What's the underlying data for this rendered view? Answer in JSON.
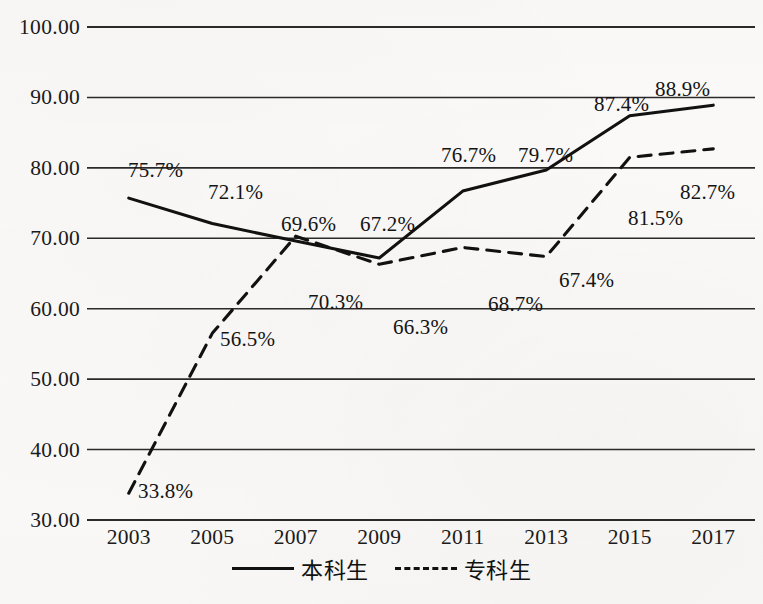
{
  "chart_data": {
    "type": "line",
    "title": "",
    "xlabel": "",
    "ylabel": "",
    "categories": [
      "2003",
      "2005",
      "2007",
      "2009",
      "2011",
      "2013",
      "2015",
      "2017"
    ],
    "ylim": [
      30,
      100
    ],
    "ytick_labels": [
      "100.00",
      "90.00",
      "80.00",
      "70.00",
      "60.00",
      "50.00",
      "40.00",
      "30.00"
    ],
    "ytick_values": [
      100,
      90,
      80,
      70,
      60,
      50,
      40,
      30
    ],
    "grid": true,
    "legend_position": "bottom-center",
    "series": [
      {
        "name": "本科生",
        "style": "solid",
        "color": "#111111",
        "values": [
          75.7,
          72.1,
          69.6,
          67.2,
          76.7,
          79.7,
          87.4,
          88.9
        ],
        "labels": [
          "75.7%",
          "72.1%",
          "69.6%",
          "67.2%",
          "76.7%",
          "79.7%",
          "87.4%",
          "88.9%"
        ]
      },
      {
        "name": "专科生",
        "style": "dashed",
        "color": "#111111",
        "values": [
          33.8,
          56.5,
          70.3,
          66.3,
          68.7,
          67.4,
          81.5,
          82.7
        ],
        "labels": [
          "33.8%",
          "56.5%",
          "70.3%",
          "66.3%",
          "68.7%",
          "67.4%",
          "81.5%",
          "82.7%"
        ]
      }
    ],
    "point_labels": [
      {
        "text": "75.7%",
        "series": "本科生",
        "category": "2003",
        "x": 128,
        "y": 158
      },
      {
        "text": "72.1%",
        "series": "本科生",
        "category": "2005",
        "x": 208,
        "y": 180
      },
      {
        "text": "69.6%",
        "series": "本科生",
        "category": "2007",
        "x": 281,
        "y": 212
      },
      {
        "text": "67.2%",
        "series": "本科生",
        "category": "2009",
        "x": 360,
        "y": 212
      },
      {
        "text": "76.7%",
        "series": "本科生",
        "category": "2011",
        "x": 441,
        "y": 143
      },
      {
        "text": "79.7%",
        "series": "本科生",
        "category": "2013",
        "x": 518,
        "y": 143
      },
      {
        "text": "87.4%",
        "series": "本科生",
        "category": "2015",
        "x": 594,
        "y": 92
      },
      {
        "text": "88.9%",
        "series": "本科生",
        "category": "2017",
        "x": 655,
        "y": 77
      },
      {
        "text": "33.8%",
        "series": "专科生",
        "category": "2003",
        "x": 138,
        "y": 479
      },
      {
        "text": "56.5%",
        "series": "专科生",
        "category": "2005",
        "x": 220,
        "y": 327
      },
      {
        "text": "70.3%",
        "series": "专科生",
        "category": "2007",
        "x": 308,
        "y": 290
      },
      {
        "text": "66.3%",
        "series": "专科生",
        "category": "2009",
        "x": 393,
        "y": 315
      },
      {
        "text": "68.7%",
        "series": "专科生",
        "category": "2011",
        "x": 488,
        "y": 292
      },
      {
        "text": "67.4%",
        "series": "专科生",
        "category": "2013",
        "x": 559,
        "y": 268
      },
      {
        "text": "81.5%",
        "series": "专科生",
        "category": "2015",
        "x": 628,
        "y": 206
      },
      {
        "text": "82.7%",
        "series": "专科生",
        "category": "2017",
        "x": 680,
        "y": 180
      }
    ]
  },
  "legend": {
    "entries": [
      {
        "label": "本科生",
        "style": "solid"
      },
      {
        "label": "专科生",
        "style": "dashed"
      }
    ]
  }
}
